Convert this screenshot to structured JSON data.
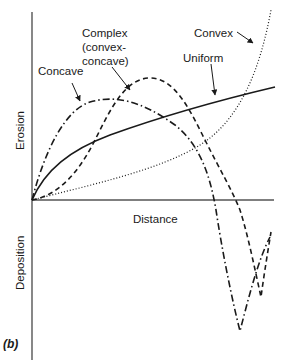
{
  "figure": {
    "panel_label": "(b)",
    "axes": {
      "x_label": "Distance",
      "y_label_positive": "Erosion",
      "y_label_negative": "Deposition"
    },
    "curves": [
      {
        "id": "concave",
        "label": "Concave",
        "line_style": "dash-dot"
      },
      {
        "id": "complex",
        "label_lines": [
          "Complex",
          "(convex-",
          "concave)"
        ],
        "line_style": "dashed"
      },
      {
        "id": "uniform",
        "label": "Uniform",
        "line_style": "solid"
      },
      {
        "id": "convex",
        "label": "Convex",
        "line_style": "dotted"
      }
    ],
    "colors": {
      "line": "#1a1a1a",
      "axis": "#555555",
      "background": "#ffffff"
    }
  }
}
